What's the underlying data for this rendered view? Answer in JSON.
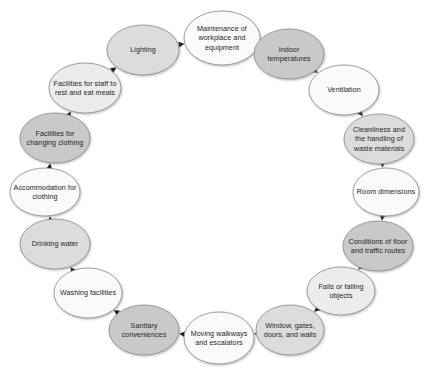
{
  "diagram": {
    "type": "cycle",
    "direction": "clockwise",
    "background_color": "#ffffff",
    "text_color": "#262626",
    "border_color": "#8c8c8c",
    "arrow_color": "#1a1a1a",
    "fills": {
      "white": "#fafafa",
      "light": "#ececec",
      "medium": "#dcdcdc",
      "dark": "#c9c9c9"
    },
    "nodes": [
      {
        "id": "maintenance",
        "label": "Maintenance of workplace and equipment",
        "fill": "#fafafa",
        "cx": 222,
        "cy": 38,
        "rx": 38,
        "ry": 27
      },
      {
        "id": "indoor-temperatures",
        "label": "Indoor temperatures",
        "fill": "#c9c9c9",
        "cx": 289,
        "cy": 54,
        "rx": 35,
        "ry": 25
      },
      {
        "id": "ventilation",
        "label": "Ventilation",
        "fill": "#fafafa",
        "cx": 344,
        "cy": 90,
        "rx": 35,
        "ry": 25
      },
      {
        "id": "cleanliness",
        "label": "Cleanliness and the handling of waste materials",
        "fill": "#dcdcdc",
        "cx": 379,
        "cy": 139,
        "rx": 35,
        "ry": 25
      },
      {
        "id": "room-dimensions",
        "label": "Room dimensions",
        "fill": "#fafafa",
        "cx": 386,
        "cy": 192,
        "rx": 33,
        "ry": 24
      },
      {
        "id": "conditions-floor",
        "label": "Conditions of floor and traffic routes",
        "fill": "#c9c9c9",
        "cx": 378,
        "cy": 246,
        "rx": 35,
        "ry": 25
      },
      {
        "id": "falls",
        "label": "Falls or falling objects",
        "fill": "#ececec",
        "cx": 341,
        "cy": 291,
        "rx": 34,
        "ry": 24
      },
      {
        "id": "window-gates",
        "label": "Window, gates, doors, and walls",
        "fill": "#dcdcdc",
        "cx": 290,
        "cy": 330,
        "rx": 34,
        "ry": 25
      },
      {
        "id": "moving-walkways",
        "label": "Moving walkways and escalators",
        "fill": "#fafafa",
        "cx": 219,
        "cy": 338,
        "rx": 35,
        "ry": 26
      },
      {
        "id": "sanitary",
        "label": "Sanitary conveniences",
        "fill": "#c9c9c9",
        "cx": 144,
        "cy": 330,
        "rx": 35,
        "ry": 25
      },
      {
        "id": "washing",
        "label": "Washing facilities",
        "fill": "#fafafa",
        "cx": 88,
        "cy": 293,
        "rx": 34,
        "ry": 25
      },
      {
        "id": "drinking-water",
        "label": "Drinking water",
        "fill": "#dcdcdc",
        "cx": 55,
        "cy": 244,
        "rx": 35,
        "ry": 25
      },
      {
        "id": "accommodation-clothing",
        "label": "Accommodation for clothing",
        "fill": "#fafafa",
        "cx": 45,
        "cy": 192,
        "rx": 35,
        "ry": 24
      },
      {
        "id": "facilities-changing",
        "label": "Facilities for changing clothing",
        "fill": "#c9c9c9",
        "cx": 55,
        "cy": 138,
        "rx": 35,
        "ry": 25
      },
      {
        "id": "facilities-rest",
        "label": "Facilities for staff to rest and eat meals",
        "fill": "#ececec",
        "cx": 85,
        "cy": 88,
        "rx": 36,
        "ry": 25
      },
      {
        "id": "lighting",
        "label": "Lighting",
        "fill": "#dcdcdc",
        "cx": 143,
        "cy": 50,
        "rx": 36,
        "ry": 25
      }
    ],
    "edges": [
      {
        "from": "maintenance",
        "to": "indoor-temperatures"
      },
      {
        "from": "indoor-temperatures",
        "to": "ventilation"
      },
      {
        "from": "ventilation",
        "to": "cleanliness"
      },
      {
        "from": "cleanliness",
        "to": "room-dimensions"
      },
      {
        "from": "room-dimensions",
        "to": "conditions-floor"
      },
      {
        "from": "conditions-floor",
        "to": "falls"
      },
      {
        "from": "falls",
        "to": "window-gates"
      },
      {
        "from": "window-gates",
        "to": "moving-walkways"
      },
      {
        "from": "moving-walkways",
        "to": "sanitary"
      },
      {
        "from": "sanitary",
        "to": "washing"
      },
      {
        "from": "washing",
        "to": "drinking-water"
      },
      {
        "from": "drinking-water",
        "to": "accommodation-clothing"
      },
      {
        "from": "accommodation-clothing",
        "to": "facilities-changing"
      },
      {
        "from": "facilities-changing",
        "to": "facilities-rest"
      },
      {
        "from": "facilities-rest",
        "to": "lighting"
      },
      {
        "from": "lighting",
        "to": "maintenance"
      }
    ]
  }
}
